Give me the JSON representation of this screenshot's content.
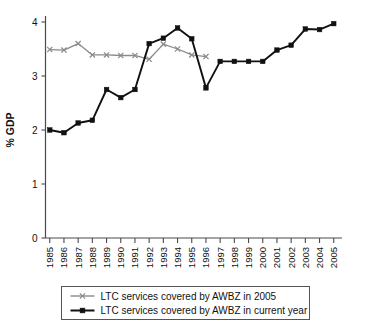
{
  "chart_data": {
    "type": "line",
    "title": "",
    "xlabel": "",
    "ylabel": "% GDP",
    "ylim": [
      0,
      4
    ],
    "yticks": [
      0,
      1,
      2,
      3,
      4
    ],
    "ytick_labels": [
      "0",
      "1",
      "2",
      "3",
      "4"
    ],
    "grid": false,
    "legend_position": "bottom",
    "categories": [
      "1985",
      "1986",
      "1987",
      "1988",
      "1989",
      "1990",
      "1991",
      "1992",
      "1993",
      "1994",
      "1995",
      "1996",
      "1997",
      "1998",
      "1999",
      "2000",
      "2001",
      "2002",
      "2003",
      "2004",
      "2005"
    ],
    "series": [
      {
        "name": "LTC services covered by AWBZ in 2005",
        "color": "#8a8a8a",
        "marker": "x",
        "values": [
          3.49,
          3.48,
          3.6,
          3.39,
          3.39,
          3.38,
          3.38,
          3.31,
          3.59,
          3.5,
          3.39,
          3.36,
          null,
          null,
          null,
          null,
          null,
          null,
          null,
          null,
          null
        ]
      },
      {
        "name": "LTC services covered by AWBZ in current year",
        "color": "#111111",
        "marker": "square",
        "values": [
          2.0,
          1.95,
          2.13,
          2.18,
          2.75,
          2.6,
          2.75,
          3.6,
          3.7,
          3.89,
          3.69,
          2.78,
          3.27,
          3.27,
          3.27,
          3.27,
          3.48,
          3.57,
          3.87,
          3.86,
          3.97
        ]
      }
    ]
  },
  "legend": {
    "entries": [
      {
        "label": "LTC services covered by AWBZ in 2005"
      },
      {
        "label": "LTC services covered by AWBZ in current year"
      }
    ]
  }
}
